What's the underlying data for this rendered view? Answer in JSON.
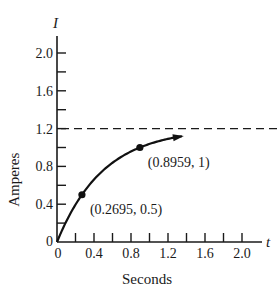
{
  "chart_data": {
    "type": "line",
    "title": "",
    "xlabel": "Seconds",
    "ylabel": "Amperes",
    "x_var": "t",
    "y_var": "I",
    "xlim": [
      0,
      2.2
    ],
    "ylim": [
      0,
      2.2
    ],
    "x_ticks": [
      0,
      0.2,
      0.4,
      0.6,
      0.8,
      1.0,
      1.2,
      1.4,
      1.6,
      1.8,
      2.0
    ],
    "x_tick_labels": [
      "0",
      "0.4",
      "0.8",
      "1.2",
      "1.6",
      "2.0"
    ],
    "x_tick_label_values": [
      0,
      0.4,
      0.8,
      1.2,
      1.6,
      2.0
    ],
    "y_ticks": [
      0.2,
      0.4,
      0.6,
      0.8,
      1.0,
      1.2,
      1.4,
      1.6,
      1.8,
      2.0
    ],
    "y_tick_labels": [
      "0",
      "0.4",
      "0.8",
      "1.2",
      "1.6",
      "2.0"
    ],
    "y_tick_label_values": [
      0,
      0.4,
      0.8,
      1.2,
      1.6,
      2.0
    ],
    "grid": false,
    "series": [
      {
        "name": "I(t) = 1.2(1 - e^(-2t))",
        "function": {
          "amplitude": 1.2,
          "rate": 2
        },
        "t_range": [
          0,
          1.35
        ],
        "arrow_at_end": true
      }
    ],
    "asymptote": {
      "y": 1.2,
      "style": "dashed"
    },
    "points": [
      {
        "x": 0.2695,
        "y": 0.5,
        "label": "(0.2695, 0.5)"
      },
      {
        "x": 0.8959,
        "y": 1,
        "label": "(0.8959, 1)"
      }
    ]
  }
}
